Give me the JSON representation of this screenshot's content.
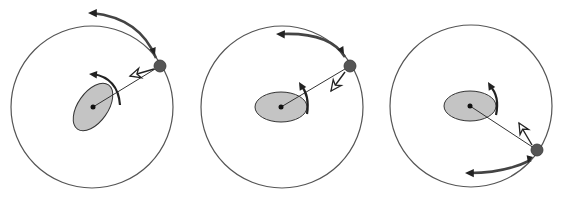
{
  "diagram": {
    "colors": {
      "background": "#ffffff",
      "orbit": "#555555",
      "body_fill": "#c4c4c4",
      "body_stroke": "#333333",
      "satellite": "#555555",
      "arrow": "#222222",
      "orbit_arrow": "#444444",
      "open_arrow_fill": "#ffffff"
    },
    "panels": [
      {
        "id": "panel-1",
        "orbit": {
          "cx": 92,
          "cy": 107,
          "r": 81
        },
        "body": {
          "cx": 93,
          "cy": 107,
          "rx": 15,
          "ry": 27,
          "rotate": 35
        },
        "center_dot": {
          "cx": 93,
          "cy": 107,
          "r": 2.5
        },
        "satellite": {
          "cx": 160,
          "cy": 66,
          "r": 6
        },
        "tether": {
          "x1": 93,
          "y1": 107,
          "x2": 160,
          "y2": 66
        },
        "orbit_arrow": {
          "path": "M 156 58 Q 140 18 92 13",
          "head": {
            "x": 88,
            "y": 13,
            "angle": 180
          },
          "tail_head": {
            "x": 155,
            "y": 55,
            "angle": 70
          }
        },
        "spin_arrow": {
          "path": "M 120 105 Q 118 78 93 74",
          "head": {
            "x": 89,
            "y": 74,
            "angle": 185
          }
        },
        "open_arrow": {
          "from": {
            "x": 154,
            "y": 69
          },
          "to": {
            "x": 130,
            "y": 76
          }
        }
      },
      {
        "id": "panel-2",
        "orbit": {
          "cx": 282,
          "cy": 107,
          "r": 81
        },
        "body": {
          "cx": 281,
          "cy": 107,
          "rx": 26,
          "ry": 15,
          "rotate": 0
        },
        "center_dot": {
          "cx": 281,
          "cy": 107,
          "r": 2.5
        },
        "satellite": {
          "cx": 350,
          "cy": 66,
          "r": 6
        },
        "tether": {
          "x1": 281,
          "y1": 107,
          "x2": 350,
          "y2": 66
        },
        "orbit_arrow": {
          "path": "M 345 57 Q 330 32 281 34",
          "head": {
            "x": 276,
            "y": 34,
            "angle": 182
          },
          "tail_head": {
            "x": 344,
            "y": 54,
            "angle": 60
          }
        },
        "spin_arrow": {
          "path": "M 307 114 Q 310 96 301 85",
          "head": {
            "x": 299,
            "y": 82,
            "angle": 240
          }
        },
        "open_arrow": {
          "from": {
            "x": 345,
            "y": 72
          },
          "to": {
            "x": 331,
            "y": 91
          }
        }
      },
      {
        "id": "panel-3",
        "orbit": {
          "cx": 471,
          "cy": 106,
          "r": 81
        },
        "body": {
          "cx": 470,
          "cy": 106,
          "rx": 26,
          "ry": 15,
          "rotate": 0
        },
        "center_dot": {
          "cx": 470,
          "cy": 106,
          "r": 2.5
        },
        "satellite": {
          "cx": 537,
          "cy": 150,
          "r": 6
        },
        "tether": {
          "x1": 470,
          "y1": 106,
          "x2": 537,
          "y2": 150
        },
        "orbit_arrow": {
          "path": "M 531 160 Q 505 173 470 173",
          "head": {
            "x": 465,
            "y": 173,
            "angle": 180
          },
          "tail_head": {
            "x": 528,
            "y": 163,
            "angle": 105
          }
        },
        "spin_arrow": {
          "path": "M 496 115 Q 500 96 490 86",
          "head": {
            "x": 488,
            "y": 82,
            "angle": 240
          }
        },
        "open_arrow": {
          "from": {
            "x": 532,
            "y": 145
          },
          "to": {
            "x": 519,
            "y": 123
          }
        }
      }
    ]
  }
}
